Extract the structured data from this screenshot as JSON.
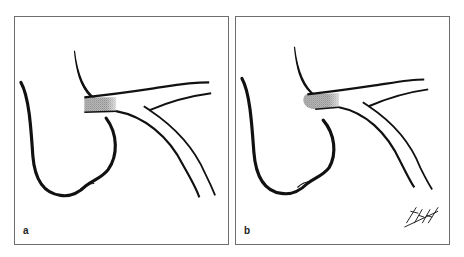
{
  "figure": {
    "panels": [
      {
        "label": "a",
        "stent_style": "straight-ended dotted mesh"
      },
      {
        "label": "b",
        "stent_style": "rounded-ended dotted mesh",
        "signature": "Titti"
      }
    ],
    "colors": {
      "line": "#111111",
      "border": "#6e6e6e",
      "stent": "#9a9a9a",
      "background": "#ffffff"
    }
  }
}
